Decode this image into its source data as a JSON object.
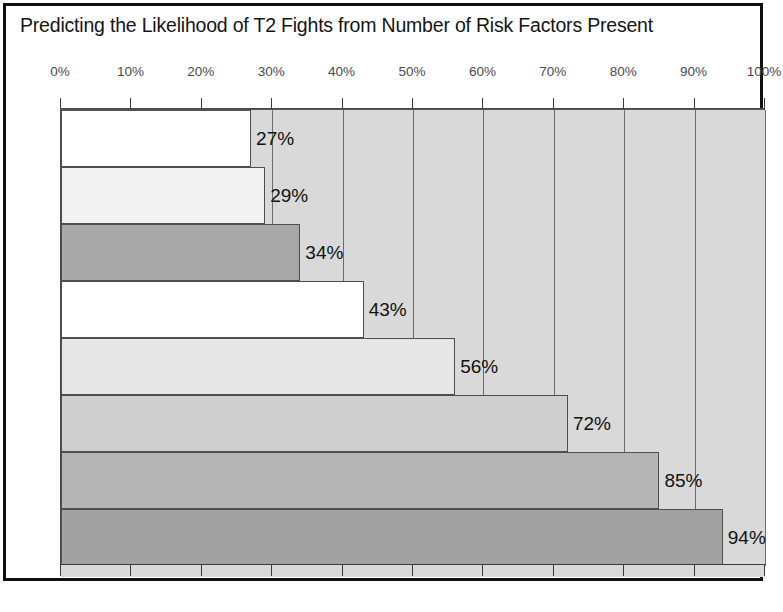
{
  "chart_data": {
    "type": "bar",
    "orientation": "horizontal",
    "title": "Predicting the Likelihood of T2 Fights from Number of Risk Factors Present",
    "xlabel": "",
    "ylabel": "",
    "xlim": [
      0,
      100
    ],
    "grid": true,
    "legend": null,
    "categories": [
      "1",
      "2",
      "3",
      "4",
      "5",
      "6",
      "7",
      "8"
    ],
    "values": [
      27,
      29,
      34,
      43,
      56,
      72,
      85,
      94
    ],
    "data_labels": [
      "27%",
      "29%",
      "34%",
      "43%",
      "56%",
      "72%",
      "85%",
      "94%"
    ],
    "bar_colors": [
      "#ffffff",
      "#f2f2f2",
      "#a8a8a8",
      "#ffffff",
      "#e6e6e6",
      "#cfcfcf",
      "#b5b5b5",
      "#a2a2a2"
    ],
    "tick_labels": [
      "0%",
      "10%",
      "20%",
      "30%",
      "40%",
      "50%",
      "60%",
      "70%",
      "80%",
      "90%",
      "100%"
    ],
    "tick_values": [
      0,
      10,
      20,
      30,
      40,
      50,
      60,
      70,
      80,
      90,
      100
    ],
    "plot_background": "#d9d9d9",
    "frame_color": "#101010"
  }
}
